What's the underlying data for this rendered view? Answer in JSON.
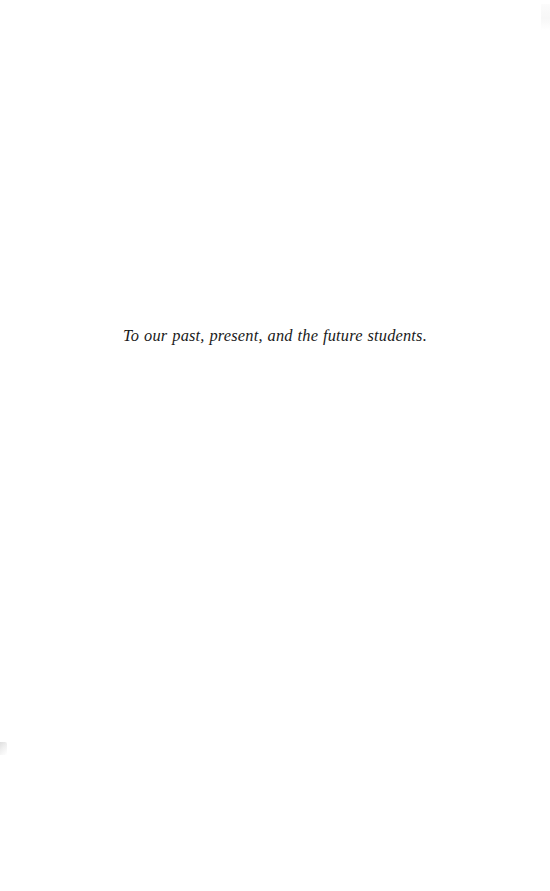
{
  "page": {
    "background_color": "#ffffff",
    "width": 550,
    "height": 891,
    "kind": "book-dedication-page"
  },
  "dedication": {
    "text": "To our past, present, and the future students.",
    "style": "italic-serif",
    "alignment": "center",
    "text_color": "#1a1a1a"
  },
  "artifacts": {
    "left_edge_mark": "",
    "right_edge_mark": ""
  }
}
